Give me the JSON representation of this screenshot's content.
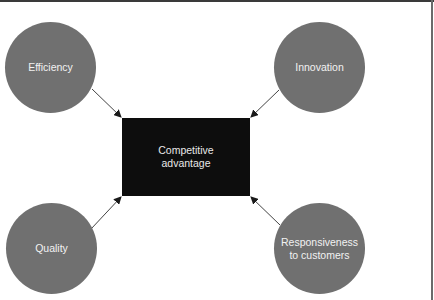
{
  "diagram": {
    "type": "hub-and-spoke",
    "center": {
      "label": "Competitive\nadvantage",
      "color": "#0d0d0d"
    },
    "nodes": [
      {
        "id": "efficiency",
        "label": "Efficiency",
        "position": "top-left"
      },
      {
        "id": "innovation",
        "label": "Innovation",
        "position": "top-right"
      },
      {
        "id": "quality",
        "label": "Quality",
        "position": "bottom-left"
      },
      {
        "id": "responsiveness",
        "label": "Responsiveness\nto customers",
        "position": "bottom-right"
      }
    ],
    "edges": [
      {
        "from": "efficiency",
        "to": "center"
      },
      {
        "from": "innovation",
        "to": "center"
      },
      {
        "from": "quality",
        "to": "center"
      },
      {
        "from": "responsiveness",
        "to": "center"
      }
    ],
    "colors": {
      "node_fill": "#707070",
      "node_text": "#f2f2f2",
      "arrow": "#333333"
    }
  }
}
